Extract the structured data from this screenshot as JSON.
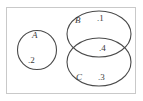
{
  "figure": {
    "type": "venn-diagram",
    "caption": "",
    "universe": {
      "shape": "rectangle",
      "border_color": "#c9c9c9",
      "fill_color": "#ffffff"
    },
    "stroke_color": "#4a4a4a",
    "text_color": "#3a3a3a",
    "sets": [
      {
        "id": "A",
        "label": "A",
        "shape": "circle",
        "cx": 37,
        "cy": 50,
        "r": 20,
        "overlaps": []
      },
      {
        "id": "B",
        "label": "B",
        "shape": "circle",
        "cx": 99,
        "cy": 34,
        "rx": 32,
        "ry": 23,
        "overlaps": [
          "C"
        ]
      },
      {
        "id": "C",
        "label": "C",
        "shape": "circle",
        "cx": 99,
        "cy": 62,
        "rx": 32,
        "ry": 24,
        "overlaps": [
          "B"
        ]
      }
    ],
    "points": [
      {
        "id": "p2",
        "label": ".2",
        "value": "2",
        "member_of": [
          "A"
        ],
        "x": 28,
        "y": 56
      },
      {
        "id": "p1",
        "label": ".1",
        "value": "1",
        "member_of": [
          "B"
        ],
        "x": 97,
        "y": 14
      },
      {
        "id": "p4",
        "label": ".4",
        "value": "4",
        "member_of": [
          "B",
          "C"
        ],
        "x": 99,
        "y": 44
      },
      {
        "id": "p3",
        "label": ".3",
        "value": "3",
        "member_of": [
          "C"
        ],
        "x": 98,
        "y": 73
      }
    ]
  }
}
